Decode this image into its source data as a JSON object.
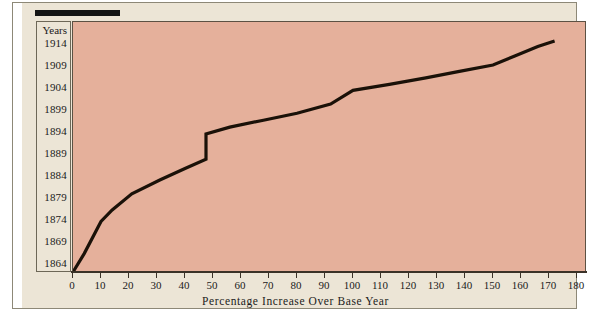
{
  "figure": {
    "background_color": "#ece5d6",
    "plot_background_color": "#e5b09b",
    "line_color": "#1a1108",
    "axis_color": "#3a3228"
  },
  "axes": {
    "y_header": "Years",
    "y_tick_labels": [
      "1914",
      "1909",
      "1904",
      "1899",
      "1894",
      "1889",
      "1884",
      "1879",
      "1874",
      "1869",
      "1864"
    ],
    "x_tick_labels": [
      "0",
      "10",
      "20",
      "30",
      "40",
      "50",
      "60",
      "70",
      "80",
      "90",
      "100",
      "110",
      "120",
      "130",
      "140",
      "150",
      "160",
      "170",
      "180"
    ],
    "x_title": "Percentage Increase Over Base Year"
  },
  "chart_data": {
    "type": "line",
    "title": "",
    "subtitle": "",
    "xlabel": "Percentage Increase Over Base Year",
    "ylabel": "Years",
    "xlim": [
      0,
      180
    ],
    "ylim": [
      1864,
      1916
    ],
    "xticks": [
      0,
      10,
      20,
      30,
      40,
      50,
      60,
      70,
      80,
      90,
      100,
      110,
      120,
      130,
      140,
      150,
      160,
      170,
      180
    ],
    "yticks": [
      1864,
      1869,
      1874,
      1879,
      1884,
      1889,
      1894,
      1899,
      1904,
      1909,
      1914
    ],
    "grid": false,
    "legend": null,
    "series": [
      {
        "name": "Percentage increase over base year",
        "x": [
          0,
          4,
          10,
          14,
          21,
          31,
          40,
          47.5,
          47.5,
          56,
          68,
          80,
          92,
          100,
          113,
          126,
          138,
          150,
          158,
          166,
          172
        ],
        "y": [
          1864,
          1868,
          1875,
          1877.5,
          1881,
          1884,
          1886.5,
          1888.5,
          1894,
          1895.5,
          1897,
          1898.5,
          1900.5,
          1903.5,
          1904.8,
          1906.2,
          1907.6,
          1909,
          1911,
          1913,
          1914.2
        ]
      }
    ],
    "annotations": [
      {
        "text": "vertical discontinuity at approximately 47.5 percent, jumping from 1888.5 to 1894",
        "x": 47.5,
        "y": 1891
      }
    ]
  }
}
